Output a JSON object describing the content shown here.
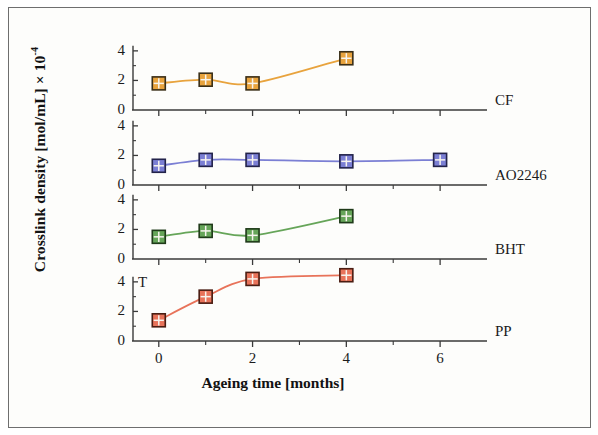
{
  "figure": {
    "y_axis_title_main": "Crosslink density [mol/mL] × 10",
    "y_axis_title_exp": "-4",
    "x_axis_title": "Ageing time [months]",
    "annotation_T": "T",
    "background_color": "#fdfdfb",
    "border_color": "#6e6e6e",
    "axis_color": "#3a3a3a"
  },
  "axes": {
    "y_ticks": [
      "0",
      "2",
      "4"
    ],
    "x_ticks": [
      "0",
      "2",
      "4",
      "6"
    ]
  },
  "chart_data": {
    "type": "line",
    "title": "",
    "xlabel": "Ageing time [months]",
    "ylabel": "Crosslink density [mol/mL] × 10^-4",
    "xlim": [
      -0.55,
      7.0
    ],
    "ylim": [
      0,
      4.6
    ],
    "x_ticks_major": [
      0,
      2,
      4,
      6
    ],
    "x_ticks_minor": [
      1,
      3,
      5
    ],
    "y_ticks_major": [
      0,
      2,
      4
    ],
    "y_ticks_minor": [
      1,
      3
    ],
    "grid": false,
    "legend_position": "right-of-each-panel",
    "panels": [
      {
        "label": "CF",
        "color": "#E8A33D",
        "marker_edge": "#3a2f18",
        "x": [
          0,
          1,
          2,
          4
        ],
        "y": [
          1.8,
          2.05,
          1.8,
          3.5
        ]
      },
      {
        "label": "AO2246",
        "color": "#7B7FD4",
        "marker_edge": "#23234a",
        "x": [
          0,
          1,
          2,
          4,
          6
        ],
        "y": [
          1.3,
          1.7,
          1.7,
          1.6,
          1.7
        ]
      },
      {
        "label": "BHT",
        "color": "#66A559",
        "marker_edge": "#1f3a19",
        "x": [
          0,
          1,
          2,
          4
        ],
        "y": [
          1.5,
          1.9,
          1.6,
          2.9
        ]
      },
      {
        "label": "PP",
        "color": "#E8735A",
        "marker_edge": "#4a1d12",
        "x": [
          0,
          1,
          2,
          4
        ],
        "y": [
          1.4,
          3.0,
          4.2,
          4.45
        ]
      }
    ]
  }
}
